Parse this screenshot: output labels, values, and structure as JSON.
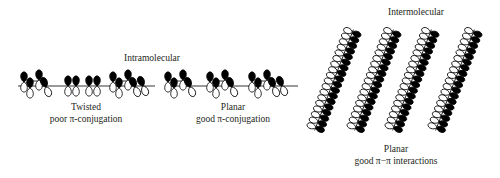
{
  "diagram": {
    "labels": {
      "intramolecular": "Intramolecular",
      "intermolecular": "Intermolecular",
      "twisted_title": "Twisted",
      "twisted_caption": "poor π-conjugation",
      "planar_title": "Planar",
      "planar_caption": "good π-conjugation",
      "stacked_title": "Planar",
      "stacked_caption": "good π−π interactions"
    },
    "panels": [
      {
        "id": "twisted-chain",
        "type": "horizontal-chain",
        "conformation": "twisted",
        "orbital_count": 16
      },
      {
        "id": "planar-chain",
        "type": "horizontal-chain",
        "conformation": "planar",
        "orbital_count": 16
      },
      {
        "id": "stacked-chains",
        "type": "pi-stacked-chains",
        "chain_count": 4
      }
    ],
    "colors": {
      "ink": "#231f20",
      "lobe_filled": "#000000",
      "lobe_open": "#ffffff",
      "background": "#ffffff"
    }
  }
}
